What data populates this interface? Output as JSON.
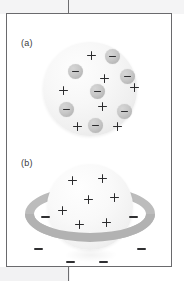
{
  "figure": {
    "border_color": "#6a6a6d",
    "background": "#ffffff",
    "panels": [
      {
        "id": "panel-a",
        "label": "(a)",
        "model_name": "plum-pudding-model",
        "sphere": {
          "fill_light": "#fdfdfd",
          "fill_dark": "#dddddd"
        },
        "electron_color": "#c0c0c0",
        "sign_color": "#2b2b2d",
        "electron_count": 8,
        "plus_count": 7,
        "electrons": [
          {
            "x": 62,
            "y": 7,
            "sign": "−"
          },
          {
            "x": 25,
            "y": 22,
            "sign": "−"
          },
          {
            "x": 77,
            "y": 27,
            "sign": "−"
          },
          {
            "x": 47,
            "y": 42,
            "sign": "−"
          },
          {
            "x": 16,
            "y": 60,
            "sign": "−"
          },
          {
            "x": 74,
            "y": 62,
            "sign": "−"
          },
          {
            "x": 45,
            "y": 76,
            "sign": "−"
          }
        ],
        "pluses": [
          {
            "x": 44,
            "y": 9
          },
          {
            "x": 57,
            "y": 32
          },
          {
            "x": 16,
            "y": 44
          },
          {
            "x": 87,
            "y": 41
          },
          {
            "x": 55,
            "y": 60
          },
          {
            "x": 30,
            "y": 80
          },
          {
            "x": 70,
            "y": 80
          }
        ]
      },
      {
        "id": "panel-b",
        "label": "(b)",
        "model_name": "saturnian-model",
        "sphere": {
          "fill_light": "#fefefe",
          "fill_dark": "#e0e0e0"
        },
        "ring_color": "#bcbcbc",
        "electron_color": "#2f2f31",
        "ring_electron_count": 6,
        "plus_count": 7,
        "ring_electrons": [
          {
            "x": 16,
            "y": 30
          },
          {
            "x": 104,
            "y": 30
          },
          {
            "x": 9,
            "y": 62
          },
          {
            "x": 112,
            "y": 62
          },
          {
            "x": 41,
            "y": 75
          },
          {
            "x": 74,
            "y": 75
          }
        ],
        "pluses": [
          {
            "x": 43,
            "y": 14
          },
          {
            "x": 73,
            "y": 12
          },
          {
            "x": 59,
            "y": 33
          },
          {
            "x": 85,
            "y": 31
          },
          {
            "x": 33,
            "y": 44
          },
          {
            "x": 50,
            "y": 58
          },
          {
            "x": 77,
            "y": 56
          }
        ]
      }
    ]
  }
}
